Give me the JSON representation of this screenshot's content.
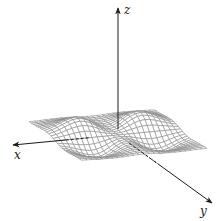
{
  "figure": {
    "type": "3d-surface-wireframe",
    "background": "#ffffff",
    "mesh_color": "#8a8a8a",
    "axis_color": "#1a1a1a"
  },
  "axes": {
    "x": {
      "label": "x",
      "tip": [
        13,
        145
      ],
      "label_pos": [
        14,
        159
      ]
    },
    "y": {
      "label": "y",
      "tip": [
        212,
        203
      ],
      "label_pos": [
        200,
        215
      ]
    },
    "z": {
      "label": "z",
      "tip": [
        118,
        8
      ],
      "label_pos": [
        124,
        14
      ]
    },
    "origin": [
      118,
      135
    ]
  },
  "projection": {
    "origin": [
      118,
      135
    ],
    "ex": [
      -31.3,
      3.0
    ],
    "ey": [
      13.1,
      9.5
    ],
    "ez": [
      0,
      -38
    ]
  },
  "surface": {
    "domain": {
      "x": [
        -2,
        2
      ],
      "y": [
        -2,
        2
      ]
    },
    "grid": {
      "nx": 24,
      "ny": 24
    },
    "function": "z = -2.2 * y * x^2 * exp(-(x^2 + y^2))",
    "features": [
      {
        "kind": "peak",
        "approx_pixel": [
          91,
          88
        ]
      },
      {
        "kind": "peak",
        "approx_pixel": [
          111,
          102
        ]
      },
      {
        "kind": "trough",
        "approx_pixel": [
          126,
          180
        ]
      },
      {
        "kind": "trough",
        "approx_pixel": [
          145,
          192
        ]
      }
    ]
  },
  "chart_data": {
    "type": "surface",
    "title": "",
    "xlabel": "x",
    "ylabel": "y",
    "zlabel": "z",
    "x_range": [
      -2,
      2
    ],
    "y_range": [
      -2,
      2
    ],
    "grid": false,
    "legend": null
  }
}
